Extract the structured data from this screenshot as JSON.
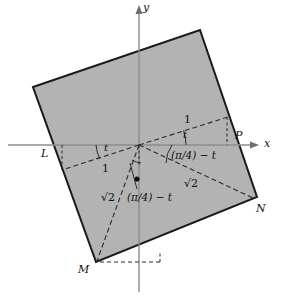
{
  "figure": {
    "colors": {
      "square_fill": "#b3b3b3",
      "square_stroke": "#1a1a1a",
      "axis": "#8c8c8c",
      "dashed": "#2b2b2b",
      "text": "#101010",
      "background": "#ffffff"
    },
    "axes": {
      "x_label": "x",
      "y_label": "y",
      "origin": {
        "x": 139,
        "y": 145
      }
    },
    "vertices": [
      {
        "name": "L",
        "label": "L",
        "x": 57,
        "y": 146,
        "label_x": 41,
        "label_y": 148
      },
      {
        "name": "P",
        "label": "P",
        "x": 232,
        "y": 144,
        "label_x": 235,
        "label_y": 130
      },
      {
        "name": "N",
        "label": "N",
        "x": 253,
        "y": 200,
        "label_x": 256,
        "label_y": 203
      },
      {
        "name": "M",
        "label": "M",
        "x": 97,
        "y": 262,
        "label_x": 78,
        "label_y": 264
      }
    ],
    "square_corners": [
      {
        "x": 33,
        "y": 87
      },
      {
        "x": 200,
        "y": 30
      },
      {
        "x": 257,
        "y": 197
      },
      {
        "x": 96,
        "y": 262
      }
    ],
    "labels": {
      "len_top": "1",
      "len_left": "1",
      "angle_t_upper": "t",
      "angle_t_left": "t",
      "expr_right": "(π/4) − t",
      "expr_lower": "(π/4) − t",
      "radical_left": "√2",
      "radical_right": "√2"
    }
  }
}
